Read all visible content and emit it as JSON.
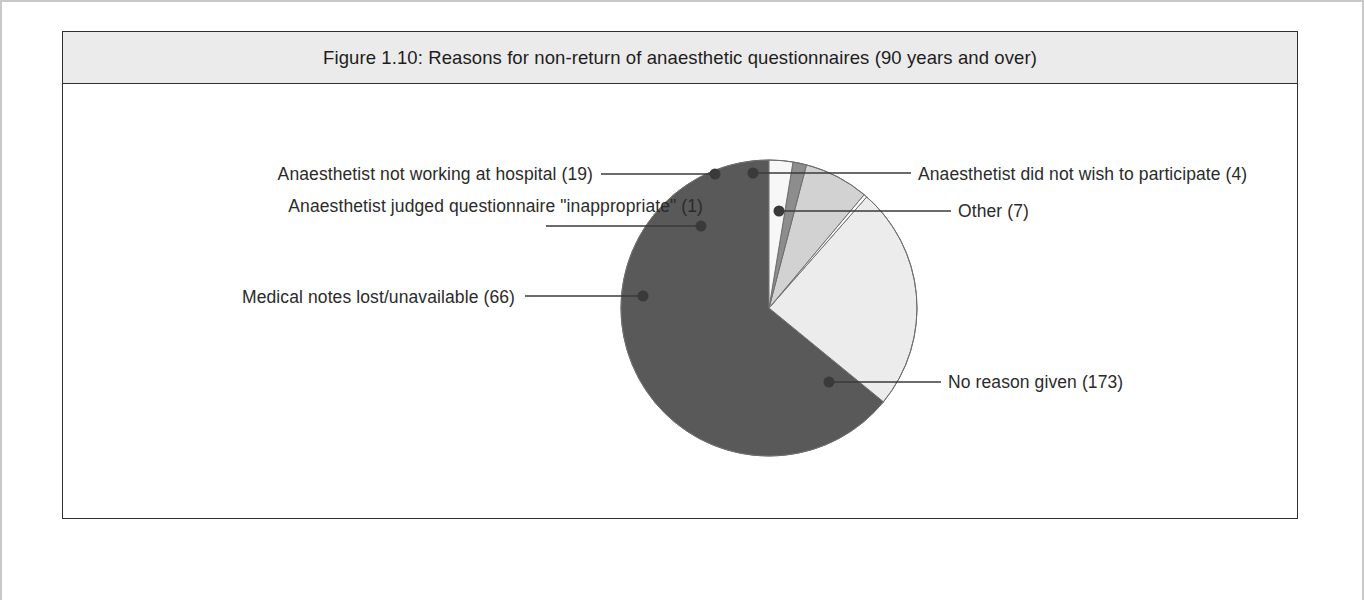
{
  "figure": {
    "title": "Figure 1.10: Reasons for non-return of anaesthetic questionnaires (90 years and over)",
    "background": "#ffffff",
    "title_bar_color": "#ebebeb",
    "border_color": "#2f2f2f"
  },
  "chart_data": {
    "type": "pie",
    "title": "Figure 1.10: Reasons for non-return of anaesthetic questionnaires (90 years and over)",
    "xlabel": "",
    "ylabel": "",
    "total": 270,
    "start_angle_deg": 0,
    "direction": "counter-clockwise",
    "legend_position": "callout-labels",
    "grid": false,
    "labels": [
      "No reason given (173)",
      "Medical notes lost/unavailable (66)",
      "Anaesthetist judged questionnaire \"inappropriate\" (1)",
      "Anaesthetist not working at hospital (19)",
      "Anaesthetist did not wish to participate (4)",
      "Other (7)"
    ],
    "categories": [
      "No reason given",
      "Medical notes lost/unavailable",
      "Anaesthetist judged questionnaire \"inappropriate\"",
      "Anaesthetist not working at hospital",
      "Anaesthetist did not wish to participate",
      "Other"
    ],
    "values": [
      173,
      66,
      1,
      19,
      4,
      7
    ],
    "colors": [
      "#595959",
      "#ececec",
      "#ffffff",
      "#d2d2d2",
      "#8d8d8d",
      "#f7f7f7"
    ],
    "slices": [
      {
        "label": "No reason given (173)",
        "category": "No reason given",
        "value": 173,
        "color": "#595959",
        "percent": "64.1%",
        "label_side": "right",
        "label_x": 947,
        "label_y": 373,
        "leader_from_x": 828,
        "leader_from_y": 381,
        "leader_to_x": 940,
        "leader_to_y": 381,
        "dot_x": 828,
        "dot_y": 381
      },
      {
        "label": "Medical notes lost/unavailable (66)",
        "category": "Medical notes lost/unavailable",
        "value": 66,
        "color": "#ececec",
        "percent": "24.4%",
        "label_side": "left",
        "label_x": 514,
        "label_y": 288,
        "leader_from_x": 642,
        "leader_from_y": 295,
        "leader_to_x": 524,
        "leader_to_y": 295,
        "dot_x": 642,
        "dot_y": 295
      },
      {
        "label": "Anaesthetist judged questionnaire \"inappropriate\" (1)",
        "category": "Anaesthetist judged questionnaire \"inappropriate\"",
        "value": 1,
        "color": "#ffffff",
        "percent": "0.4%",
        "label_side": "left",
        "label_x": 702,
        "label_y": 197,
        "leader_from_x": 700,
        "leader_from_y": 225,
        "leader_to_x": 545,
        "leader_to_y": 225,
        "dot_x": 700,
        "dot_y": 225
      },
      {
        "label": "Anaesthetist not working at hospital (19)",
        "category": "Anaesthetist not working at hospital",
        "value": 19,
        "color": "#d2d2d2",
        "percent": "7.0%",
        "label_side": "left",
        "label_x": 592,
        "label_y": 165,
        "leader_from_x": 714,
        "leader_from_y": 173,
        "leader_to_x": 600,
        "leader_to_y": 173,
        "dot_x": 714,
        "dot_y": 173
      },
      {
        "label": "Anaesthetist did not wish to participate (4)",
        "category": "Anaesthetist did not wish to participate",
        "value": 4,
        "color": "#8d8d8d",
        "percent": "1.5%",
        "label_side": "right",
        "label_x": 917,
        "label_y": 165,
        "leader_from_x": 752,
        "leader_from_y": 172,
        "leader_to_x": 910,
        "leader_to_y": 172,
        "dot_x": 752,
        "dot_y": 172
      },
      {
        "label": "Other (7)",
        "category": "Other",
        "value": 7,
        "color": "#f7f7f7",
        "percent": "2.6%",
        "label_side": "right",
        "label_x": 957,
        "label_y": 202,
        "leader_from_x": 778,
        "leader_from_y": 210,
        "leader_to_x": 950,
        "leader_to_y": 210,
        "dot_x": 778,
        "dot_y": 210
      }
    ],
    "geometry": {
      "center_x": 768,
      "center_y": 307,
      "radius": 148,
      "outline_color": "#6e6e6e",
      "leader_color": "#3a3a3a",
      "dot_radius": 5.5
    }
  }
}
